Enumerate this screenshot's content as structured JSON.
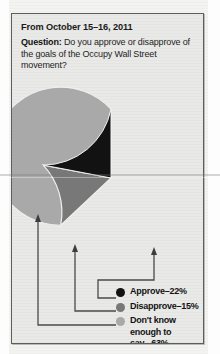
{
  "panel": {
    "date_line": "From October 15–16, 2011",
    "question_label": "Question:",
    "question_text": " Do you approve or disapprove of the goals of the Occupy Wall Street movement?"
  },
  "colors": {
    "approve": "#121212",
    "disapprove": "#787878",
    "dont_know": "#a9a9a9",
    "panel_bg": "#e9e9e7",
    "panel_border": "#5d5d5d",
    "leader_line": "#4a4a4a"
  },
  "legend": [
    {
      "marker": "approve-dot",
      "label": "Approve–22%",
      "color_key": "approve"
    },
    {
      "marker": "disapprove-dot",
      "label": "Disapprove–15%",
      "color_key": "disapprove"
    },
    {
      "marker": "dont-know-dot",
      "label": "Don't know\nenough to\nsay –63%",
      "color_key": "dont_know"
    }
  ],
  "chart_data": {
    "type": "pie",
    "title": "Do you approve or disapprove of the goals of the Occupy Wall Street movement?",
    "subtitle": "From October 15–16, 2011",
    "categories": [
      "Approve",
      "Disapprove",
      "Don't know enough to say"
    ],
    "values": [
      22,
      15,
      63
    ],
    "unit": "percent",
    "labels": [
      "Approve–22%",
      "Disapprove–15%",
      "Don't know enough to say –63%"
    ],
    "colors": [
      "#121212",
      "#787878",
      "#a9a9a9"
    ],
    "start_angle_deg": 180,
    "direction": "clockwise",
    "legend_position": "bottom-right",
    "grid": false
  }
}
